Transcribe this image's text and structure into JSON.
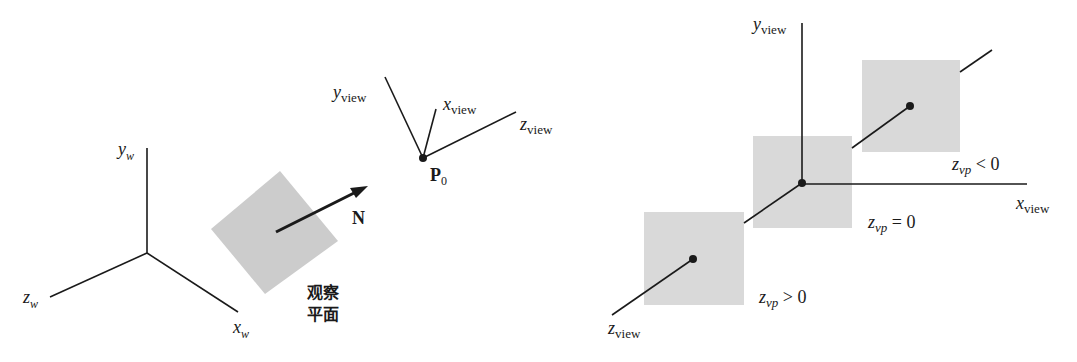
{
  "left_diagram": {
    "world_axes": {
      "y": {
        "base": "y",
        "sub": "w"
      },
      "x": {
        "base": "x",
        "sub": "w"
      },
      "z": {
        "base": "z",
        "sub": "w"
      }
    },
    "normal_label": "N",
    "view_plane_label": [
      "观察",
      "平面"
    ],
    "origin_label": {
      "base": "P",
      "sub": "0"
    },
    "view_axes": {
      "y": {
        "base": "y",
        "sub": "view"
      },
      "x": {
        "base": "x",
        "sub": "view"
      },
      "z": {
        "base": "z",
        "sub": "view"
      }
    }
  },
  "right_diagram": {
    "axes": {
      "y": {
        "base": "y",
        "sub": "view"
      },
      "x": {
        "base": "x",
        "sub": "view"
      },
      "z": {
        "base": "z",
        "sub": "view"
      }
    },
    "planes": [
      {
        "base": "z",
        "sub": "vp",
        "rel": " > 0"
      },
      {
        "base": "z",
        "sub": "vp",
        "rel": " = 0"
      },
      {
        "base": "z",
        "sub": "vp",
        "rel": " < 0"
      }
    ]
  },
  "colors": {
    "line": "#1a1a1a",
    "plane_fill": "#d9d9d9",
    "tilted_plane_fill": "#cccccc"
  }
}
